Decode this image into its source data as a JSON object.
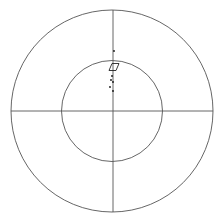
{
  "plot": {
    "type": "polar-projection",
    "width": 218,
    "height": 224,
    "center": [
      112,
      111
    ],
    "outer_radius": 101,
    "inner_radius": 50.5,
    "line_color": "#555555",
    "point_color": "#111111"
  },
  "chart_data": {
    "type": "scatter",
    "title": "",
    "grid": "two concentric circles with crosshair axes",
    "axes_ranges": {
      "outer_circle": 1.0,
      "inner_circle": 0.5
    },
    "markers": [
      {
        "shape": "parallelogram",
        "x": 114,
        "y": 67,
        "size": 7
      }
    ],
    "points": [
      {
        "x": 114,
        "y": 51
      },
      {
        "x": 112,
        "y": 76
      },
      {
        "x": 111,
        "y": 80
      },
      {
        "x": 113,
        "y": 82
      },
      {
        "x": 110,
        "y": 87
      },
      {
        "x": 113,
        "y": 91
      }
    ]
  }
}
